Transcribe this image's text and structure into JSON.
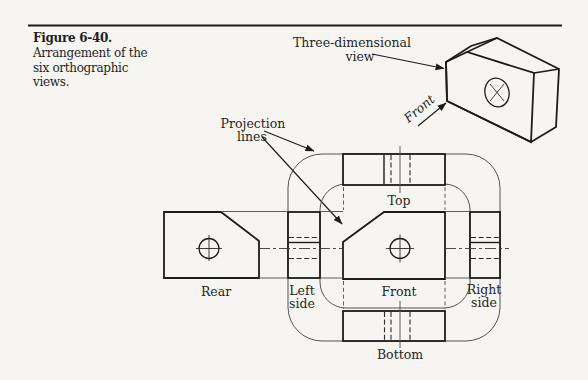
{
  "caption": {
    "number": "Figure 6-40.",
    "line1": "Arrangement of the",
    "line2": "six orthographic",
    "line3": "views."
  },
  "callouts": {
    "three_dimensional_line1": "Three-dimensional",
    "three_dimensional_line2": "view",
    "front_pictorial": "Front",
    "projection_line1": "Projection",
    "projection_line2": "lines"
  },
  "view_labels": {
    "top": "Top",
    "front": "Front",
    "rear": "Rear",
    "left_line1": "Left",
    "left_line2": "side",
    "right_line1": "Right",
    "right_line2": "side",
    "bottom": "Bottom"
  },
  "colors": {
    "background": "#f6f5f1",
    "ink": "#1c1c1c",
    "face_gray": "#b5b7b4",
    "thin_line": "#4f4f4f"
  }
}
